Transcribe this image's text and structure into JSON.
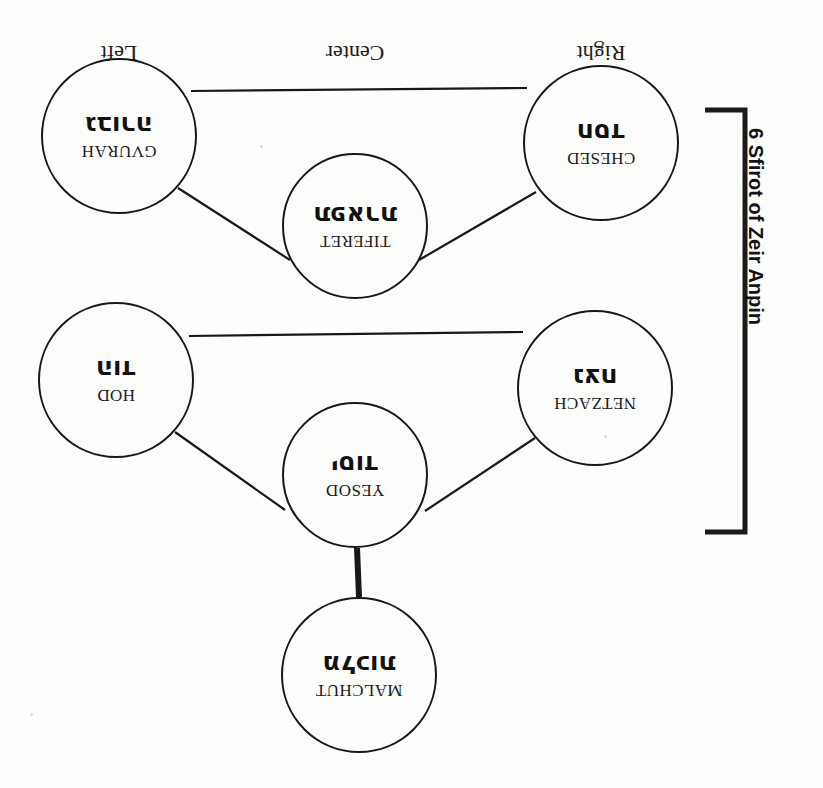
{
  "diagram": {
    "title": "6 Sfirot of Zeir Anpin",
    "group_bracket_label": "6 Sfirot of Zeir Anpin",
    "columns": [
      {
        "id": "right",
        "label": "Right"
      },
      {
        "id": "center",
        "label": "Center"
      },
      {
        "id": "left",
        "label": "Left"
      }
    ],
    "nodes": [
      {
        "id": "chesed",
        "latin": "CHESED",
        "hebrew": "חסד",
        "column": "right",
        "cx": 222,
        "cy": 645,
        "r": 78
      },
      {
        "id": "gvurah",
        "latin": "GVURAH",
        "hebrew": "גבורה",
        "column": "left",
        "cx": 704,
        "cy": 652,
        "r": 78
      },
      {
        "id": "tiferet",
        "latin": "TIFERET",
        "hebrew": "תפארת",
        "column": "center",
        "cx": 468,
        "cy": 562,
        "r": 73
      },
      {
        "id": "netzach",
        "latin": "NETZACH",
        "hebrew": "נצח",
        "column": "right",
        "cx": 228,
        "cy": 400,
        "r": 78
      },
      {
        "id": "hod",
        "latin": "HOD",
        "hebrew": "הוד",
        "column": "left",
        "cx": 707,
        "cy": 408,
        "r": 78
      },
      {
        "id": "yesod",
        "latin": "YESOD",
        "hebrew": "יסוד",
        "column": "center",
        "cx": 468,
        "cy": 313,
        "r": 73
      },
      {
        "id": "malchut",
        "latin": "MALCHUT",
        "hebrew": "מלכות",
        "column": "center",
        "cx": 464,
        "cy": 113,
        "r": 78
      }
    ],
    "connections": [
      {
        "from": "malchut",
        "to": "yesod",
        "style": "thick"
      },
      {
        "from": "yesod",
        "to": "netzach",
        "style": "thin"
      },
      {
        "from": "yesod",
        "to": "hod",
        "style": "thin"
      },
      {
        "from": "netzach",
        "to": "hod",
        "style": "thin"
      },
      {
        "from": "tiferet",
        "to": "chesed",
        "style": "thin"
      },
      {
        "from": "tiferet",
        "to": "gvurah",
        "style": "thin"
      },
      {
        "from": "chesed",
        "to": "gvurah",
        "style": "thin"
      }
    ],
    "colors": {
      "ink": "#18181a",
      "paper": "#fdfdfc"
    }
  }
}
